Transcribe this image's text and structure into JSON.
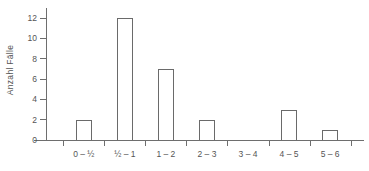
{
  "chart_data": {
    "type": "bar",
    "title": "",
    "subtitle": "",
    "xlabel": "",
    "ylabel": "Anzahl Fälle",
    "categories": [
      "0 – ½",
      "½ – 1",
      "1 – 2",
      "2 – 3",
      "3 – 4",
      "4 – 5",
      "5 – 6"
    ],
    "values": [
      2,
      12,
      7,
      2,
      0,
      3,
      1
    ],
    "ylim": [
      0,
      13
    ],
    "ytick_labels": [
      "0",
      "2",
      "4",
      "6",
      "8",
      "10",
      "12"
    ],
    "ytick_values": [
      0,
      2,
      4,
      6,
      8,
      10,
      12
    ],
    "grid": false,
    "legend": false,
    "legend_position": "none",
    "bar_style": "outlined",
    "annotations": []
  },
  "style": {
    "background": "#ffffff",
    "axis_color": "#6e6e6e",
    "bar_outline": "#6a6a6a",
    "text_color": "#555555"
  }
}
